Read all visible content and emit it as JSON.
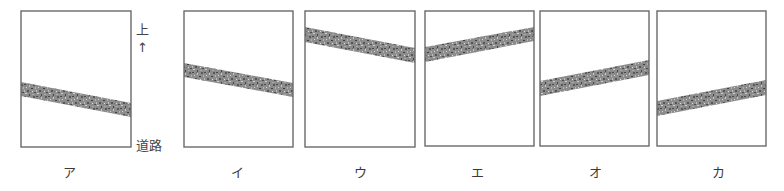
{
  "figure": {
    "side_labels": {
      "up": "上",
      "arrow": "↑",
      "road": "道路"
    },
    "colors": {
      "frame": "#6a6a6a",
      "stripe_base": "#8c8c8c",
      "stripe_dark": "#4a4a4a",
      "stripe_light": "#c8c8c8",
      "background": "#ffffff"
    },
    "panels": [
      {
        "label": "ア",
        "box": [
          21,
          11,
          110,
          136
        ],
        "stripe": {
          "left_top": 82,
          "left_bottom": 96,
          "right_top": 103,
          "right_bottom": 117
        },
        "label_x": 69
      },
      {
        "label": "イ",
        "box": [
          184,
          11,
          109,
          136
        ],
        "stripe": {
          "left_top": 63,
          "left_bottom": 77,
          "right_top": 83,
          "right_bottom": 97
        },
        "label_x": 237
      },
      {
        "label": "ウ",
        "box": [
          305,
          11,
          110,
          136
        ],
        "stripe": {
          "left_top": 27,
          "left_bottom": 42,
          "right_top": 48,
          "right_bottom": 63
        },
        "label_x": 360
      },
      {
        "label": "エ",
        "box": [
          425,
          11,
          109,
          135
        ],
        "stripe": {
          "left_top": 47,
          "left_bottom": 62,
          "right_top": 27,
          "right_bottom": 41
        },
        "label_x": 477
      },
      {
        "label": "オ",
        "box": [
          540,
          11,
          109,
          135
        ],
        "stripe": {
          "left_top": 81,
          "left_bottom": 96,
          "right_top": 60,
          "right_bottom": 75
        },
        "label_x": 595
      },
      {
        "label": "カ",
        "box": [
          657,
          11,
          109,
          135
        ],
        "stripe": {
          "left_top": 101,
          "left_bottom": 116,
          "right_top": 80,
          "right_bottom": 95
        },
        "label_x": 718
      }
    ]
  }
}
